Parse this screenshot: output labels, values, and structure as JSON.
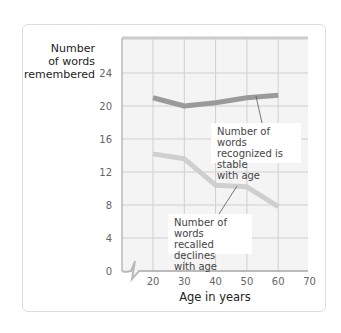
{
  "chart_data": {
    "type": "line",
    "title": "",
    "xlabel": "Age in years",
    "ylabel": "Number of words remembered",
    "x": [
      20,
      30,
      40,
      50,
      60
    ],
    "x_ticks": [
      20,
      30,
      40,
      50,
      60,
      70
    ],
    "y_ticks": [
      0,
      4,
      8,
      12,
      16,
      20,
      24
    ],
    "xlim": [
      10,
      70
    ],
    "ylim": [
      0,
      28
    ],
    "grid": true,
    "axis_break": "x-axis between 0 and 20",
    "series": [
      {
        "name": "Number of words recognized",
        "values": [
          21.0,
          20.0,
          20.4,
          21.0,
          21.3
        ],
        "color": "#9a9a9a"
      },
      {
        "name": "Number of words recalled",
        "values": [
          14.2,
          13.6,
          10.4,
          10.2,
          7.8
        ],
        "color": "#cfcfcf"
      }
    ],
    "annotations": [
      {
        "text": "Number of words recognized is stable with age",
        "series": "Number of words recognized"
      },
      {
        "text": "Number of words recalled declines with age",
        "series": "Number of words recalled"
      }
    ]
  },
  "labels": {
    "ylabel_lines": [
      "Number",
      "of words",
      "remembered"
    ],
    "xlabel": "Age in years",
    "note_recognized": [
      "Number of words",
      "recognized is stable",
      "with age"
    ],
    "note_recalled": [
      "Number of words",
      "recalled declines",
      "with age"
    ]
  }
}
